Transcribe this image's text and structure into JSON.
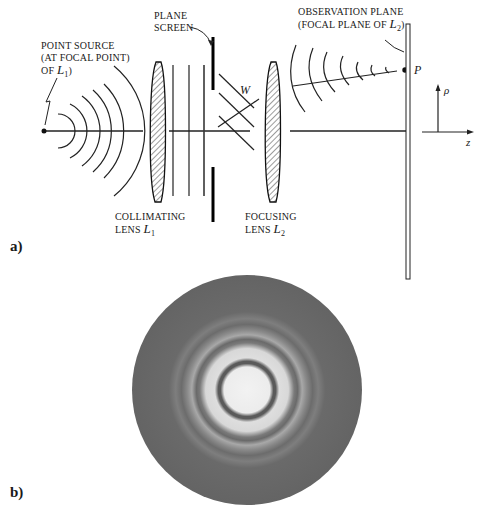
{
  "panel_a": {
    "label": "a)",
    "point_source": {
      "line1": "POINT SOURCE",
      "line2": "(AT FOCAL POINT)",
      "line3_prefix": "OF ",
      "lens_symbol": "L",
      "lens_sub": "1",
      "line3_suffix": ")"
    },
    "plane_screen": {
      "line1": "PLANE",
      "line2": "SCREEN"
    },
    "observation_plane": {
      "line1": "OBSERVATION PLANE",
      "line2_prefix": "(FOCAL PLANE OF ",
      "lens_symbol": "L",
      "lens_sub": "2",
      "line2_suffix": ")"
    },
    "collimating_lens": {
      "line1": "COLLIMATING",
      "line2_prefix": "LENS ",
      "lens_symbol": "L",
      "lens_sub": "1"
    },
    "focusing_lens": {
      "line1": "FOCUSING",
      "line2_prefix": "LENS ",
      "lens_symbol": "L",
      "lens_sub": "2"
    },
    "wavefront_label": "W",
    "point_label": "P",
    "axis_rho": "ρ",
    "axis_z": "z"
  },
  "panel_b": {
    "label": "b)",
    "description": "Circular diffraction pattern (Airy rings)"
  }
}
